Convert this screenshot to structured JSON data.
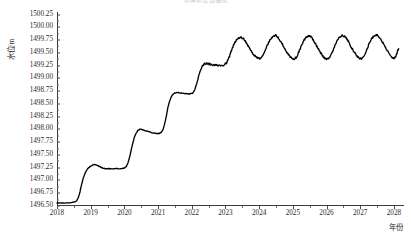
{
  "chart_data": {
    "type": "line",
    "title": "水库水位过程线",
    "xlabel": "年份",
    "ylabel": "水位/m",
    "grid": false,
    "legend": null,
    "line_color": "#000000",
    "xlim": [
      2018,
      2028.3
    ],
    "ylim": [
      1496.5,
      1500.3
    ],
    "ytick_labels": [
      "1500.25",
      "1500.00",
      "1499.75",
      "1499.50",
      "1499.25",
      "1499.00",
      "1498.75",
      "1498.50",
      "1498.25",
      "1498.00",
      "1497.75",
      "1497.50",
      "1497.25",
      "1497.00",
      "1496.75",
      "1496.50"
    ],
    "ytick_values": [
      1500.25,
      1500.0,
      1499.75,
      1499.5,
      1499.25,
      1499.0,
      1498.75,
      1498.5,
      1498.25,
      1498.0,
      1497.75,
      1497.5,
      1497.25,
      1497.0,
      1496.75,
      1496.5
    ],
    "xtick_labels": [
      "2018",
      "2019",
      "2020",
      "2021",
      "2022",
      "2023",
      "2024",
      "2025",
      "2026",
      "2027",
      "2028"
    ],
    "xtick_values": [
      2018,
      2019,
      2020,
      2021,
      2022,
      2023,
      2024,
      2025,
      2026,
      2027,
      2028
    ],
    "series": [
      {
        "name": "水位",
        "x": [
          2018.0,
          2018.15,
          2018.3,
          2018.45,
          2018.58,
          2018.66,
          2018.74,
          2018.82,
          2018.9,
          2018.98,
          2019.06,
          2019.14,
          2019.22,
          2019.3,
          2019.38,
          2019.46,
          2019.56,
          2019.7,
          2019.85,
          2019.98,
          2020.06,
          2020.14,
          2020.22,
          2020.3,
          2020.38,
          2020.46,
          2020.56,
          2020.7,
          2020.85,
          2020.98,
          2021.06,
          2021.14,
          2021.22,
          2021.3,
          2021.38,
          2021.46,
          2021.56,
          2021.7,
          2021.85,
          2021.98,
          2022.06,
          2022.14,
          2022.22,
          2022.3,
          2022.38,
          2022.46,
          2022.56,
          2022.7,
          2022.85,
          2022.98,
          2023.08,
          2023.18,
          2023.28,
          2023.38,
          2023.48,
          2023.58,
          2023.68,
          2023.78,
          2023.88,
          2023.98,
          2024.08,
          2024.18,
          2024.28,
          2024.38,
          2024.48,
          2024.58,
          2024.68,
          2024.78,
          2024.88,
          2024.98,
          2025.08,
          2025.18,
          2025.28,
          2025.38,
          2025.48,
          2025.58,
          2025.68,
          2025.78,
          2025.88,
          2025.98,
          2026.08,
          2026.18,
          2026.28,
          2026.38,
          2026.48,
          2026.58,
          2026.68,
          2026.78,
          2026.88,
          2026.98,
          2027.08,
          2027.18,
          2027.28,
          2027.38,
          2027.48,
          2027.58,
          2027.68,
          2027.78,
          2027.88,
          2027.98,
          2028.06,
          2028.14
        ],
        "y": [
          1496.56,
          1496.56,
          1496.56,
          1496.57,
          1496.6,
          1496.72,
          1496.95,
          1497.12,
          1497.22,
          1497.27,
          1497.3,
          1497.31,
          1497.29,
          1497.26,
          1497.24,
          1497.23,
          1497.23,
          1497.23,
          1497.23,
          1497.24,
          1497.28,
          1497.42,
          1497.65,
          1497.85,
          1497.96,
          1498.0,
          1497.99,
          1497.96,
          1497.93,
          1497.92,
          1497.93,
          1497.99,
          1498.18,
          1498.45,
          1498.62,
          1498.7,
          1498.72,
          1498.71,
          1498.7,
          1498.7,
          1498.74,
          1498.88,
          1499.08,
          1499.22,
          1499.28,
          1499.29,
          1499.27,
          1499.26,
          1499.26,
          1499.27,
          1499.36,
          1499.55,
          1499.7,
          1499.78,
          1499.8,
          1499.74,
          1499.63,
          1499.52,
          1499.44,
          1499.39,
          1499.42,
          1499.55,
          1499.7,
          1499.8,
          1499.84,
          1499.79,
          1499.68,
          1499.56,
          1499.46,
          1499.39,
          1499.4,
          1499.52,
          1499.68,
          1499.79,
          1499.83,
          1499.78,
          1499.67,
          1499.55,
          1499.45,
          1499.38,
          1499.4,
          1499.53,
          1499.69,
          1499.8,
          1499.84,
          1499.79,
          1499.68,
          1499.56,
          1499.46,
          1499.39,
          1499.41,
          1499.54,
          1499.7,
          1499.81,
          1499.85,
          1499.8,
          1499.69,
          1499.57,
          1499.47,
          1499.4,
          1499.44,
          1499.58
        ]
      }
    ],
    "annotations": {
      "description": "阶梯式上升后形成年周期锯齿波动",
      "initial_level": 1496.56,
      "final_level": 1499.58,
      "peak_level": 1499.85,
      "trough_level": 1499.38
    }
  }
}
